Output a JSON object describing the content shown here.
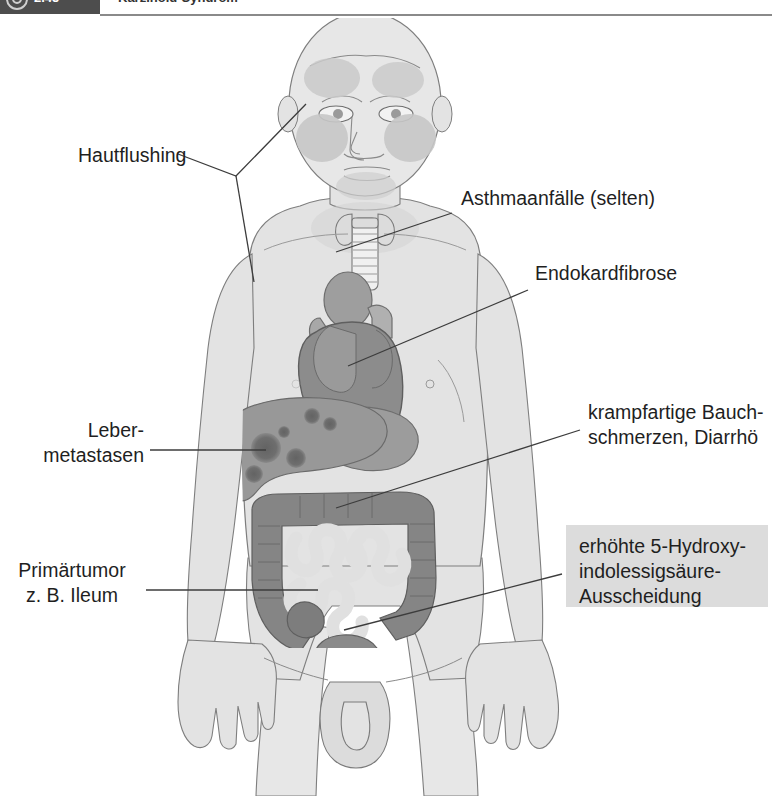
{
  "header": {
    "chapter_number": "2.45",
    "title": "Karzinoid-Syndrom",
    "badge_icon": "target-circle-icon"
  },
  "figure": {
    "labels": {
      "hautflushing": "Hautflushing",
      "asthma": "Asthmaanfälle (selten)",
      "endokardfibrose": "Endokardfibrose",
      "krampfartige": "krampfartige Bauch-\nschmerzen, Diarrhö",
      "lebermetastasen": "Leber-\nmetastasen",
      "primaertumor": "Primärtumor\nz. B. Ileum",
      "hydroxy_box": "erhöhte 5-Hydroxy-\nindolessigsäure-\nAusscheidung"
    },
    "structures": [
      "face-flush-patches",
      "thyroid-gland",
      "trachea",
      "heart",
      "aortic-arch",
      "liver-with-metastases",
      "stomach",
      "colon",
      "small-intestine",
      "rectum",
      "bladder-genitalia"
    ],
    "colors": {
      "skin": "#e3e3e3",
      "skin_outline": "#7a7a7a",
      "flush_patch": "#c4c4c4",
      "organ_mid": "#b4b4b4",
      "organ_dark": "#8f8f8f",
      "organ_darker": "#7e7e7e",
      "metastasis": "#6e6e6e",
      "callout_line": "#3c3c3c",
      "box_background": "#dcdcdc",
      "header_dark": "#4d4d4d",
      "text": "#1f1f1f"
    }
  }
}
